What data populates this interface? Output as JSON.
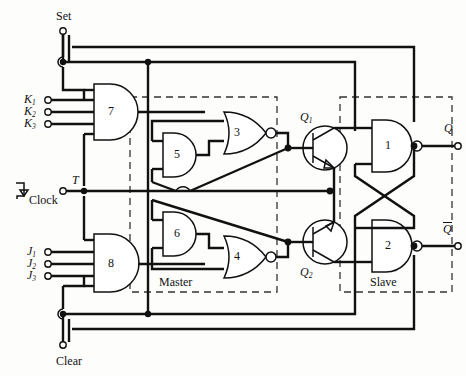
{
  "figure": {
    "kind": "logic-schematic",
    "title_visible": false
  },
  "colors": {
    "line": "#111111",
    "dashed": "#222222",
    "background": "#fdfdfb",
    "gate_fill": "#ffffff"
  },
  "terminals": {
    "set": "Set",
    "clear": "Clear",
    "clock": "Clock",
    "clock_symbol_label": "T",
    "k_inputs": [
      "K",
      "K",
      "K"
    ],
    "k_subs": [
      "1",
      "2",
      "3"
    ],
    "j_inputs": [
      "J",
      "J",
      "J"
    ],
    "j_subs": [
      "1",
      "2",
      "3"
    ],
    "q_out": "Q",
    "qbar_out": "Q"
  },
  "gates": [
    {
      "id": "g1",
      "label": "1",
      "type": "nand",
      "section": "slave"
    },
    {
      "id": "g2",
      "label": "2",
      "type": "nand",
      "section": "slave"
    },
    {
      "id": "g3",
      "label": "3",
      "type": "nor",
      "section": "master"
    },
    {
      "id": "g4",
      "label": "4",
      "type": "nor",
      "section": "master"
    },
    {
      "id": "g5",
      "label": "5",
      "type": "and",
      "section": "master"
    },
    {
      "id": "g6",
      "label": "6",
      "type": "and",
      "section": "master"
    },
    {
      "id": "g7",
      "label": "7",
      "type": "and",
      "section": "input"
    },
    {
      "id": "g8",
      "label": "8",
      "type": "and",
      "section": "input"
    }
  ],
  "transistors": [
    {
      "id": "q1",
      "label": "Q",
      "sub": "1",
      "type": "npn"
    },
    {
      "id": "q2",
      "label": "Q",
      "sub": "2",
      "type": "npn"
    }
  ],
  "sections": [
    {
      "id": "master",
      "label": "Master"
    },
    {
      "id": "slave",
      "label": "Slave"
    }
  ]
}
